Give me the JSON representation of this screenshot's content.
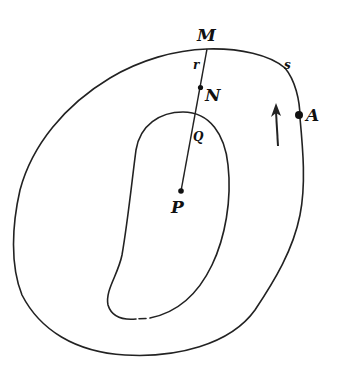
{
  "figure": {
    "type": "geometric-diagram",
    "colors": {
      "stroke": "#222222",
      "background": "#ffffff"
    },
    "labels": {
      "M": "M",
      "r": "r",
      "N": "N",
      "Q": "Q",
      "P": "P",
      "s": "s",
      "A": "A"
    },
    "points": {
      "M": {
        "x": 207,
        "y": 49
      },
      "N": {
        "x": 200,
        "y": 88
      },
      "Q": {
        "x": 195,
        "y": 115
      },
      "P": {
        "x": 181,
        "y": 191
      },
      "A": {
        "x": 298,
        "y": 115
      }
    },
    "arrow": {
      "direction": "up",
      "meaning": "counterclockwise traversal"
    }
  }
}
